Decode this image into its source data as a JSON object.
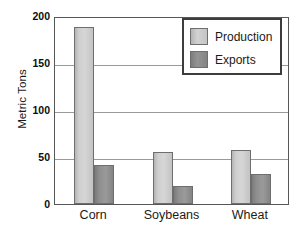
{
  "chart_data": {
    "type": "bar",
    "title": "",
    "xlabel": "",
    "ylabel": "Metric Tons",
    "categories": [
      "Corn",
      "Soybeans",
      "Wheat"
    ],
    "series": [
      {
        "name": "Production",
        "color": "#cfcfcf",
        "values": [
          188,
          55,
          57
        ]
      },
      {
        "name": "Exports",
        "color": "#8f8f8f",
        "values": [
          41,
          19,
          32
        ]
      }
    ],
    "ylim": [
      0,
      200
    ],
    "yticks": [
      0,
      50,
      100,
      150,
      200
    ],
    "ytick_labels": [
      "0",
      "50",
      "100",
      "150",
      "200"
    ],
    "grid": true,
    "legend_position": "top-right",
    "annotations": []
  },
  "legend": {
    "items": [
      {
        "label": "Production",
        "swatch": "production"
      },
      {
        "label": "Exports",
        "swatch": "exports"
      }
    ]
  },
  "axis": {
    "y_title": "Metric Tons"
  }
}
